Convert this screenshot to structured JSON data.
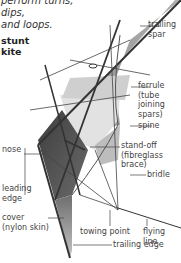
{
  "intro_text": "perform turns, dips,\nand loops.",
  "title": "stunt\nkite",
  "labels": {
    "trailing_spar": "trailing\nspar",
    "ferrule": "ferrule\n(tube joining\nspars)",
    "spine": "spine",
    "nose": "nose",
    "stand_off": "stand-off\n(fibreglass brace)",
    "bridle": "bridle",
    "leading_edge": "leading\nedge",
    "cover": "cover\n(nylon skin)",
    "towing_point": "towing point",
    "flying_line": "flying line",
    "trailing_edge": "trailing edge"
  },
  "colors": {
    "sail_dark": "#5a5a5a",
    "sail_mid": "#9a9a9a",
    "sail_light": "#c8c8c8",
    "sail_pale": "#e4e4e4",
    "line": "#333333"
  }
}
